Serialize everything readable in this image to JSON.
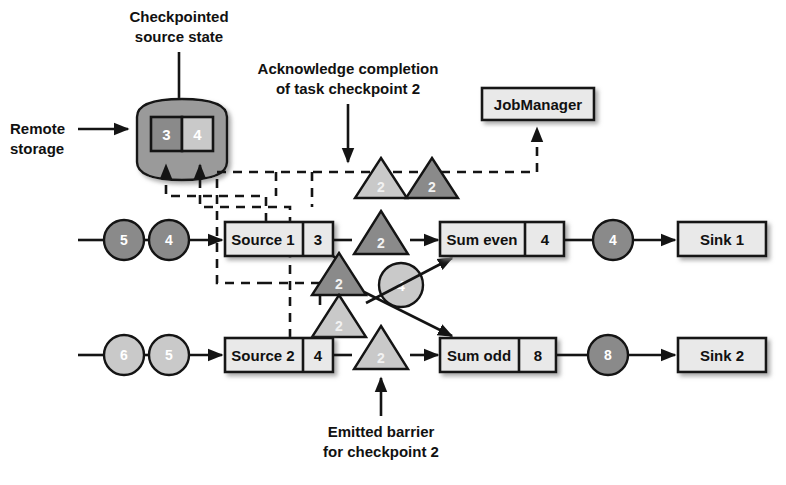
{
  "figure": {
    "colors": {
      "dark_fill": "#8a8a8a",
      "light_fill": "#c9c9c9",
      "box_fill": "#e9e9e9",
      "storage_fill": "#9a9a9a",
      "stroke": "#141414",
      "record_text": "#ffffff"
    }
  },
  "captions": {
    "checkpointed_source_state": {
      "line1": "Checkpointed",
      "line2": "source state"
    },
    "acknowledge": {
      "line1": "Acknowledge completion",
      "line2": "of task checkpoint 2"
    },
    "remote_storage": {
      "line1": "Remote",
      "line2": "storage"
    },
    "emitted_barrier": {
      "line1": "Emitted barrier",
      "line2": "for checkpoint 2"
    }
  },
  "storage": {
    "name": "remote-storage",
    "cells": [
      {
        "value": "3",
        "shade": "dark"
      },
      {
        "value": "4",
        "shade": "light"
      }
    ]
  },
  "job_manager": {
    "label": "JobManager"
  },
  "operators": {
    "source1": {
      "label": "Source 1",
      "state": "3"
    },
    "source2": {
      "label": "Source 2",
      "state": "4"
    },
    "sum_even": {
      "label": "Sum even",
      "state": "4"
    },
    "sum_odd": {
      "label": "Sum odd",
      "state": "8"
    },
    "sink1": {
      "label": "Sink 1"
    },
    "sink2": {
      "label": "Sink 2"
    }
  },
  "records": {
    "source1_input": [
      {
        "value": "5",
        "shade": "dark"
      },
      {
        "value": "4",
        "shade": "dark"
      }
    ],
    "source2_input": [
      {
        "value": "6",
        "shade": "light"
      },
      {
        "value": "5",
        "shade": "light"
      }
    ],
    "middle": [
      {
        "value": "4",
        "shade": "light"
      }
    ],
    "sink1_input": [
      {
        "value": "4",
        "shade": "dark"
      }
    ],
    "sink2_input": [
      {
        "value": "8",
        "shade": "dark"
      }
    ]
  },
  "barriers": {
    "acknowledgements": [
      {
        "value": "2",
        "shade": "light"
      },
      {
        "value": "2",
        "shade": "dark"
      }
    ],
    "stream": [
      {
        "value": "2",
        "shade": "dark",
        "position": "source1-to-sum-even"
      },
      {
        "value": "2",
        "shade": "dark",
        "position": "source1-to-sum-odd"
      },
      {
        "value": "2",
        "shade": "light",
        "position": "source2-to-sum-even"
      },
      {
        "value": "2",
        "shade": "light",
        "position": "source2-to-sum-odd"
      }
    ]
  }
}
